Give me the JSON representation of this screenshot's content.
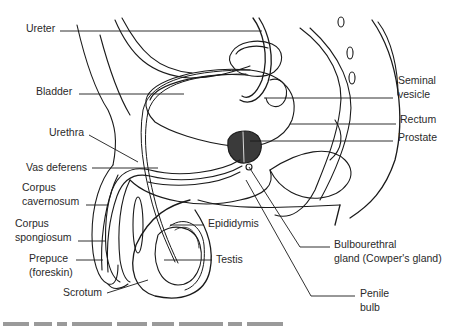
{
  "figure": {
    "type": "anatomical-illustration",
    "stroke_color": "#1a1a1a",
    "fill_dark": "#3a3a3a",
    "background": "#ffffff"
  },
  "labels": {
    "ureter": "Ureter",
    "bladder": "Bladder",
    "urethra": "Urethra",
    "vas_deferens": "Vas deferens",
    "corpus_cavernosum_1": "Corpus",
    "corpus_cavernosum_2": "cavernosum",
    "corpus_spongiosum_1": "Corpus",
    "corpus_spongiosum_2": "spongiosum",
    "prepuce_1": "Prepuce",
    "prepuce_2": "(foreskin)",
    "scrotum": "Scrotum",
    "seminal_vesicle_1": "Seminal",
    "seminal_vesicle_2": "vesicle",
    "rectum": "Rectum",
    "prostate": "Prostate",
    "epididymis": "Epididymis",
    "testis": "Testis",
    "bulbourethral_1": "Bulbourethral",
    "bulbourethral_2": "gland (Cowper's gland)",
    "penile_bulb_1": "Penile",
    "penile_bulb_2": "bulb"
  },
  "caption": {
    "visible": "partial (cut off at bottom edge, illegible)"
  }
}
